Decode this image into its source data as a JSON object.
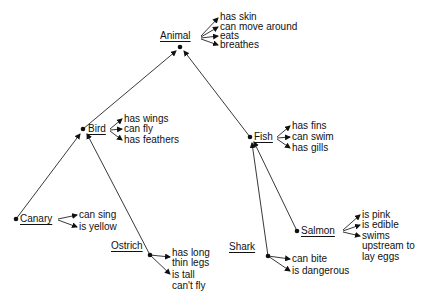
{
  "diagram": {
    "type": "semantic-network",
    "nodes": {
      "animal": {
        "label": "Animal",
        "properties": [
          "has skin",
          "can move around",
          "eats",
          "breathes"
        ]
      },
      "bird": {
        "label": "Bird",
        "properties": [
          "has wings",
          "can fly",
          "has feathers"
        ]
      },
      "fish": {
        "label": "Fish",
        "properties": [
          "has fins",
          "can swim",
          "has gills"
        ]
      },
      "canary": {
        "label": "Canary",
        "properties": [
          "can sing",
          "is yellow"
        ]
      },
      "ostrich": {
        "label": "Ostrich",
        "properties": [
          "has long",
          "thin legs",
          "is tall",
          "can't fly"
        ]
      },
      "shark": {
        "label": "Shark",
        "properties": [
          "can bite",
          "is dangerous"
        ]
      },
      "salmon": {
        "label": "Salmon",
        "properties": [
          "is pink",
          "is edible",
          "swims",
          "upstream to",
          "lay eggs"
        ]
      }
    },
    "edges": [
      {
        "from": "bird",
        "to": "animal"
      },
      {
        "from": "fish",
        "to": "animal"
      },
      {
        "from": "canary",
        "to": "bird"
      },
      {
        "from": "ostrich",
        "to": "bird"
      },
      {
        "from": "shark",
        "to": "fish"
      },
      {
        "from": "salmon",
        "to": "fish"
      }
    ]
  }
}
